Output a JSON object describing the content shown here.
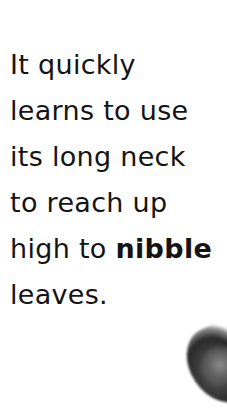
{
  "page": {
    "lines": [
      {
        "segments": [
          {
            "text": "It quickly",
            "bold": false
          }
        ]
      },
      {
        "segments": [
          {
            "text": "learns to use",
            "bold": false
          }
        ]
      },
      {
        "segments": [
          {
            "text": "its long neck",
            "bold": false
          }
        ]
      },
      {
        "segments": [
          {
            "text": "to reach up",
            "bold": false
          }
        ]
      },
      {
        "segments": [
          {
            "text": "high to ",
            "bold": false
          },
          {
            "text": "nibble",
            "bold": true
          }
        ]
      },
      {
        "segments": [
          {
            "text": "leaves.",
            "bold": false
          }
        ]
      }
    ],
    "image": {
      "description": "partial photo of animal fur (grayscale)"
    }
  }
}
